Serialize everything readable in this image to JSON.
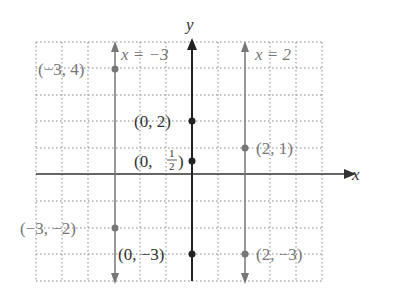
{
  "figure": {
    "axes": {
      "x_label": "x",
      "y_label": "y",
      "x_range": [
        -6,
        5
      ],
      "y_range": [
        -4,
        5
      ],
      "grid": "dotted"
    },
    "lines": [
      {
        "label": "x = −3",
        "x": -3,
        "color": "#777777"
      },
      {
        "label": "x = 2",
        "x": 2,
        "color": "#777777"
      },
      {
        "label": "",
        "x": 0,
        "color": "#222222"
      }
    ],
    "points": [
      {
        "label": "(−3, 4)",
        "x": -3,
        "y": 4,
        "color": "#777777"
      },
      {
        "label": "(−3, −2)",
        "x": -3,
        "y": -2,
        "color": "#777777"
      },
      {
        "label": "(0, 2)",
        "x": 0,
        "y": 2,
        "color": "#222222"
      },
      {
        "label_prefix": "(0, ",
        "frac_num": "1",
        "frac_den": "2",
        "label_suffix": ")",
        "x": 0,
        "y": 0.5,
        "color": "#222222"
      },
      {
        "label": "(0, −3)",
        "x": 0,
        "y": -3,
        "color": "#222222"
      },
      {
        "label": "(2, 1)",
        "x": 2,
        "y": 1,
        "color": "#777777"
      },
      {
        "label": "(2, −3)",
        "x": 2,
        "y": -3,
        "color": "#777777"
      }
    ]
  }
}
